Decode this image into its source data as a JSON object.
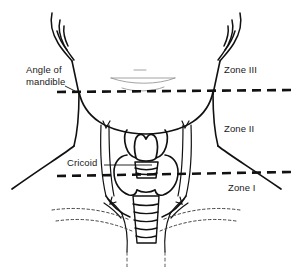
{
  "figure": {
    "background_color": "#ffffff",
    "ink_color": "#111111"
  },
  "labels": {
    "angle_of_mandible_line1": "Angle of",
    "angle_of_mandible_line2": "mandible",
    "cricoid": "Cricoid",
    "zone_iii": "Zone III",
    "zone_ii": "Zone II",
    "zone_i": "Zone I"
  },
  "boundaries": [
    {
      "name": "angle-of-mandible-boundary",
      "style": "dashed",
      "separates": [
        "Zone III",
        "Zone II"
      ],
      "landmark": "Angle of mandible"
    },
    {
      "name": "cricoid-boundary",
      "style": "dashed",
      "separates": [
        "Zone II",
        "Zone I"
      ],
      "landmark": "Cricoid"
    }
  ],
  "anatomy": [
    "head-and-jaw-outline",
    "ear-left",
    "ear-right",
    "neck-outline",
    "shoulder-left",
    "shoulder-right",
    "sternocleidomastoid-left",
    "sternocleidomastoid-right",
    "thyroid-cartilage",
    "cricoid-cartilage",
    "thyroid-gland-lobes",
    "trachea",
    "clavicle-left",
    "clavicle-right"
  ]
}
